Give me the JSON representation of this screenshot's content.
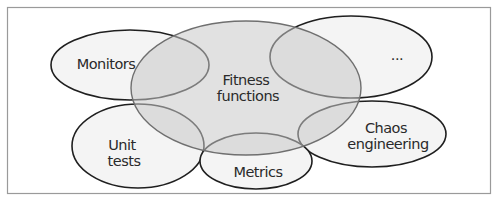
{
  "diagram": {
    "type": "overlapping-ellipses",
    "colors": {
      "frame_stroke": "#9a9a9a",
      "satellite_fill": "#f4f4f4",
      "satellite_stroke": "#1f1f1f",
      "center_fill": "#c8c8c8",
      "center_stroke": "#6f6f6f",
      "text": "#2a2a2a"
    },
    "center": {
      "id": "fitness-functions",
      "label_lines": [
        "Fitness",
        "functions"
      ]
    },
    "satellites": [
      {
        "id": "monitors",
        "label_lines": [
          "Monitors"
        ]
      },
      {
        "id": "ellipsis",
        "label_lines": [
          "..."
        ]
      },
      {
        "id": "unit-tests",
        "label_lines": [
          "Unit",
          "tests"
        ]
      },
      {
        "id": "metrics",
        "label_lines": [
          "Metrics"
        ]
      },
      {
        "id": "chaos-engineering",
        "label_lines": [
          "Chaos",
          "engineering"
        ]
      }
    ]
  }
}
